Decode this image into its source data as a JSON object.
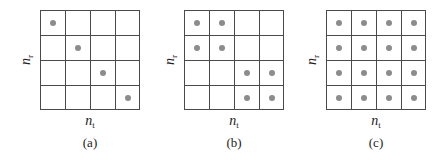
{
  "diagram": {
    "grid_size": 4,
    "axis_labels": {
      "y_base": "n",
      "y_sub": "r",
      "x_base": "n",
      "x_sub": "t"
    },
    "colors": {
      "grid_line": "#4a4a4a",
      "dot": "#8c8c8c"
    },
    "panels": [
      {
        "caption": "(a)",
        "grid_left": 40,
        "dots": [
          [
            0,
            0
          ],
          [
            1,
            1
          ],
          [
            2,
            2
          ],
          [
            3,
            3
          ]
        ]
      },
      {
        "caption": "(b)",
        "grid_left": 184,
        "dots": [
          [
            0,
            0
          ],
          [
            0,
            1
          ],
          [
            1,
            0
          ],
          [
            1,
            1
          ],
          [
            2,
            2
          ],
          [
            2,
            3
          ],
          [
            3,
            2
          ],
          [
            3,
            3
          ]
        ]
      },
      {
        "caption": "(c)",
        "grid_left": 326,
        "dots": [
          [
            0,
            0
          ],
          [
            0,
            1
          ],
          [
            0,
            2
          ],
          [
            0,
            3
          ],
          [
            1,
            0
          ],
          [
            1,
            1
          ],
          [
            1,
            2
          ],
          [
            1,
            3
          ],
          [
            2,
            0
          ],
          [
            2,
            1
          ],
          [
            2,
            2
          ],
          [
            2,
            3
          ],
          [
            3,
            0
          ],
          [
            3,
            1
          ],
          [
            3,
            2
          ],
          [
            3,
            3
          ]
        ]
      }
    ]
  }
}
